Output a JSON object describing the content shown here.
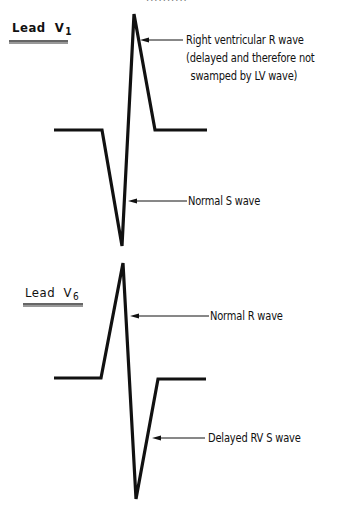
{
  "figure": {
    "top_clipped_text": "..........",
    "colors": {
      "ink": "#111111",
      "underline": "#333333",
      "background": "#ffffff"
    },
    "leads": [
      {
        "id": "V1",
        "label": {
          "prefix": "Lead",
          "lead_letter": "V",
          "lead_subscript": "1"
        },
        "label_pos": {
          "x": 12,
          "y": 20
        },
        "underline": {
          "x1": 9,
          "x2": 68,
          "y": 41
        },
        "waveform_points": [
          [
            54,
            130
          ],
          [
            102,
            130
          ],
          [
            122,
            246
          ],
          [
            134,
            14
          ],
          [
            155,
            130
          ],
          [
            207,
            130
          ]
        ],
        "annotations": [
          {
            "name": "right-ventricular-r-wave",
            "lines": [
              "Right ventricular R wave",
              "(delayed and therefore not",
              " swamped by LV wave)"
            ],
            "text_pos": {
              "x": 186,
              "y": 31
            },
            "arrow": {
              "x1": 183,
              "y1": 40,
              "x2": 140,
              "y2": 40
            }
          },
          {
            "name": "normal-s-wave",
            "lines": [
              "Normal S wave"
            ],
            "text_pos": {
              "x": 188,
              "y": 192
            },
            "arrow": {
              "x1": 187,
              "y1": 201,
              "x2": 128,
              "y2": 201
            }
          }
        ]
      },
      {
        "id": "V6",
        "label": {
          "prefix": "Lead",
          "lead_letter": "V",
          "lead_subscript": "6"
        },
        "label_pos": {
          "x": 25,
          "y": 285
        },
        "underline": {
          "x1": 23,
          "x2": 83,
          "y": 304
        },
        "waveform_points": [
          [
            54,
            378
          ],
          [
            101,
            378
          ],
          [
            123,
            263
          ],
          [
            136,
            499
          ],
          [
            158,
            379
          ],
          [
            206,
            379
          ]
        ],
        "annotations": [
          {
            "name": "normal-r-wave",
            "lines": [
              "Normal R wave"
            ],
            "text_pos": {
              "x": 210,
              "y": 307
            },
            "arrow": {
              "x1": 209,
              "y1": 316,
              "x2": 130,
              "y2": 316
            }
          },
          {
            "name": "delayed-rv-s-wave",
            "lines": [
              "Delayed RV S wave"
            ],
            "text_pos": {
              "x": 208,
              "y": 429
            },
            "arrow": {
              "x1": 205,
              "y1": 438,
              "x2": 152,
              "y2": 438
            }
          }
        ]
      }
    ]
  }
}
